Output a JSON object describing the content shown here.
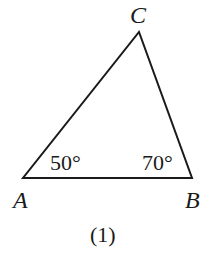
{
  "diagram": {
    "type": "triangle",
    "caption": "(1)",
    "vertices": [
      {
        "id": "A",
        "label": "A"
      },
      {
        "id": "B",
        "label": "B"
      },
      {
        "id": "C",
        "label": "C"
      }
    ],
    "angles": [
      {
        "vertex": "A",
        "label": "50°"
      },
      {
        "vertex": "B",
        "label": "70°"
      }
    ],
    "colors": {
      "stroke": "#1a1a1a",
      "background": "#ffffff"
    }
  }
}
